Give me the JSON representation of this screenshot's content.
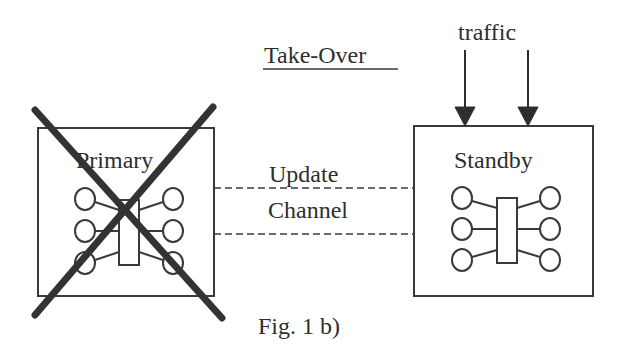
{
  "figure": {
    "title": "Take-Over",
    "caption": "Fig. 1 b)",
    "traffic_label": "traffic",
    "channel_label_line1": "Update",
    "channel_label_line2": "Channel",
    "primary": {
      "label": "Primary",
      "state": "failed (crossed out)"
    },
    "standby": {
      "label": "Standby",
      "state": "active"
    }
  },
  "colors": {
    "line": "#2e2e2e",
    "background": "#ffffff"
  }
}
